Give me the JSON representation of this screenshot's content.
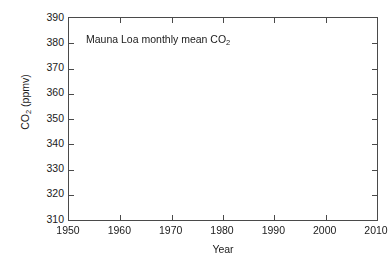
{
  "figure": {
    "background_color": "#ffffff",
    "axis_color": "#4a4a4a",
    "marker_color": "#555555"
  },
  "annotation": {
    "title_part1": "Mauna Loa monthly mean CO",
    "title_sub": "2"
  },
  "axis_titles": {
    "x": "Year",
    "y_part1": "CO",
    "y_sub": "2",
    "y_part2": " (ppmv)"
  },
  "chart_data": {
    "type": "scatter",
    "title": "Mauna Loa monthly mean CO2",
    "xlabel": "Year",
    "ylabel": "CO2 (ppmv)",
    "xlim": [
      1950,
      2010
    ],
    "ylim": [
      310,
      390
    ],
    "xticks": [
      1950,
      1960,
      1970,
      1980,
      1990,
      2000,
      2010
    ],
    "yticks": [
      310,
      320,
      330,
      340,
      350,
      360,
      370,
      380,
      390
    ],
    "xtick_labels": [
      "1950",
      "1960",
      "1970",
      "1980",
      "1990",
      "2000",
      "2010"
    ],
    "ytick_labels": [
      "310",
      "320",
      "330",
      "340",
      "350",
      "360",
      "370",
      "380",
      "390"
    ],
    "grid": false,
    "legend": null,
    "marker": "filled-circle",
    "marker_size_px": 2.6,
    "series": [
      {
        "name": "Mauna Loa monthly mean CO2",
        "color": "#555555",
        "data_start_year": 1958.2,
        "data_end_year": 2009.0,
        "seasonal_amplitude_ppm": 3.1,
        "seasonal_peak_month": 5,
        "annual_means": [
          {
            "year": 1958,
            "value": 315.3
          },
          {
            "year": 1959,
            "value": 315.98
          },
          {
            "year": 1960,
            "value": 316.91
          },
          {
            "year": 1961,
            "value": 317.64
          },
          {
            "year": 1962,
            "value": 318.45
          },
          {
            "year": 1963,
            "value": 318.99
          },
          {
            "year": 1964,
            "value": 319.62
          },
          {
            "year": 1965,
            "value": 320.04
          },
          {
            "year": 1966,
            "value": 321.38
          },
          {
            "year": 1967,
            "value": 322.16
          },
          {
            "year": 1968,
            "value": 323.04
          },
          {
            "year": 1969,
            "value": 324.62
          },
          {
            "year": 1970,
            "value": 325.68
          },
          {
            "year": 1971,
            "value": 326.32
          },
          {
            "year": 1972,
            "value": 327.45
          },
          {
            "year": 1973,
            "value": 329.68
          },
          {
            "year": 1974,
            "value": 330.18
          },
          {
            "year": 1975,
            "value": 331.11
          },
          {
            "year": 1976,
            "value": 332.04
          },
          {
            "year": 1977,
            "value": 333.83
          },
          {
            "year": 1978,
            "value": 335.4
          },
          {
            "year": 1979,
            "value": 336.84
          },
          {
            "year": 1980,
            "value": 338.75
          },
          {
            "year": 1981,
            "value": 340.11
          },
          {
            "year": 1982,
            "value": 341.45
          },
          {
            "year": 1983,
            "value": 343.05
          },
          {
            "year": 1984,
            "value": 344.65
          },
          {
            "year": 1985,
            "value": 346.12
          },
          {
            "year": 1986,
            "value": 347.42
          },
          {
            "year": 1987,
            "value": 349.19
          },
          {
            "year": 1988,
            "value": 351.57
          },
          {
            "year": 1989,
            "value": 353.12
          },
          {
            "year": 1990,
            "value": 354.39
          },
          {
            "year": 1991,
            "value": 355.61
          },
          {
            "year": 1992,
            "value": 356.45
          },
          {
            "year": 1993,
            "value": 357.1
          },
          {
            "year": 1994,
            "value": 358.83
          },
          {
            "year": 1995,
            "value": 360.82
          },
          {
            "year": 1996,
            "value": 362.61
          },
          {
            "year": 1997,
            "value": 363.73
          },
          {
            "year": 1998,
            "value": 366.7
          },
          {
            "year": 1999,
            "value": 368.38
          },
          {
            "year": 2000,
            "value": 369.55
          },
          {
            "year": 2001,
            "value": 371.14
          },
          {
            "year": 2002,
            "value": 373.28
          },
          {
            "year": 2003,
            "value": 375.8
          },
          {
            "year": 2004,
            "value": 377.52
          },
          {
            "year": 2005,
            "value": 379.8
          },
          {
            "year": 2006,
            "value": 381.9
          },
          {
            "year": 2007,
            "value": 383.79
          },
          {
            "year": 2008,
            "value": 385.6
          },
          {
            "year": 2009,
            "value": 387.4
          }
        ]
      }
    ]
  }
}
